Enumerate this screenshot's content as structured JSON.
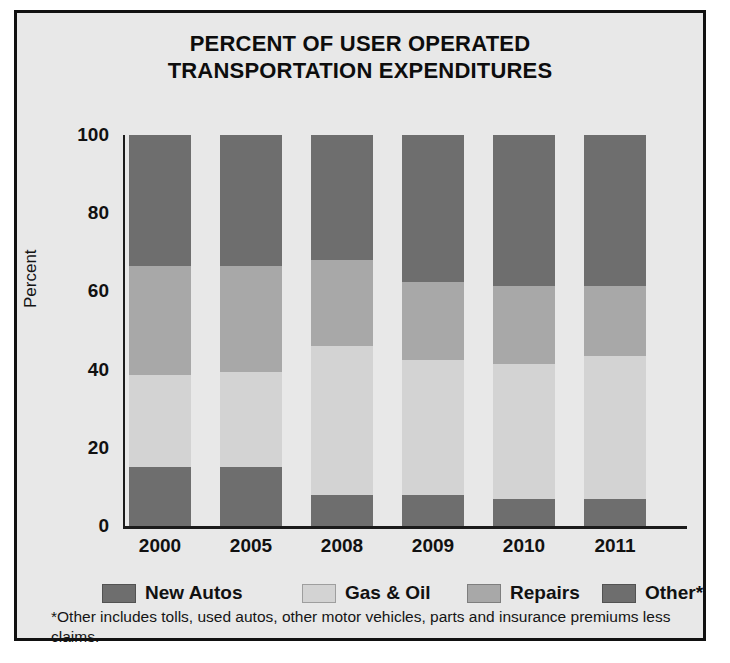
{
  "figure": {
    "title_line1": "PERCENT OF USER OPERATED",
    "title_line2": "TRANSPORTATION EXPENDITURES",
    "background_color": "#e8e8e8",
    "border_color": "#111111"
  },
  "footnote": "*Other includes tolls, used autos, other motor vehicles, parts and insurance premiums less claims.",
  "legend": {
    "items": [
      {
        "label": "New Autos",
        "color": "#6e6e6e"
      },
      {
        "label": "Gas & Oil",
        "color": "#d3d3d3"
      },
      {
        "label": "Repairs",
        "color": "#a8a8a8"
      },
      {
        "label": "Other*",
        "color": "#6e6e6e"
      }
    ]
  },
  "chart_data": {
    "type": "bar",
    "subtype": "stacked-bar-100-percent",
    "title": "PERCENT OF USER OPERATED TRANSPORTATION EXPENDITURES",
    "xlabel": "",
    "ylabel": "Percent",
    "categories": [
      "2000",
      "2005",
      "2008",
      "2009",
      "2010",
      "2011"
    ],
    "ylim": [
      0,
      100
    ],
    "yticks": [
      0,
      20,
      40,
      60,
      80,
      100
    ],
    "grid": false,
    "legend_position": "bottom",
    "stack_order_bottom_to_top": [
      "New Autos",
      "Gas & Oil",
      "Repairs",
      "Other*"
    ],
    "series": [
      {
        "name": "New Autos",
        "color": "#6e6e6e",
        "values": [
          15,
          15,
          8,
          8,
          7,
          7
        ]
      },
      {
        "name": "Gas & Oil",
        "color": "#d3d3d3",
        "values": [
          23.5,
          24.5,
          38,
          34.5,
          34.5,
          36.5
        ]
      },
      {
        "name": "Repairs",
        "color": "#a8a8a8",
        "values": [
          28,
          27,
          22,
          20,
          20,
          18
        ]
      },
      {
        "name": "Other*",
        "color": "#6e6e6e",
        "values": [
          33.5,
          33.5,
          32,
          37.5,
          38.5,
          38.5
        ]
      }
    ]
  }
}
